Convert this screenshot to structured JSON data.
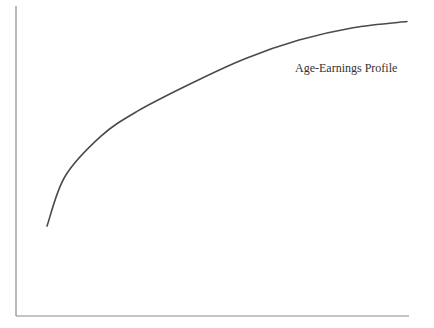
{
  "chart_data": {
    "type": "line",
    "title": "",
    "xlabel": "",
    "ylabel": "",
    "grid": false,
    "legend": "none",
    "annotations": [
      {
        "text": "Age-Earnings Profile",
        "position": "upper right, below curve"
      }
    ],
    "series": [
      {
        "name": "Age-Earnings Profile",
        "shape": "concave increasing (diminishing returns)",
        "x": [
          0,
          5,
          15,
          25,
          40,
          55,
          70,
          85,
          100
        ],
        "values": [
          29,
          45,
          58,
          66,
          75,
          83,
          89,
          93,
          95
        ]
      }
    ],
    "xlim": [
      0,
      100
    ],
    "ylim": [
      0,
      100
    ],
    "x_ticks": [],
    "y_ticks": []
  },
  "labels": {
    "curve_label": "Age-Earnings Profile"
  }
}
